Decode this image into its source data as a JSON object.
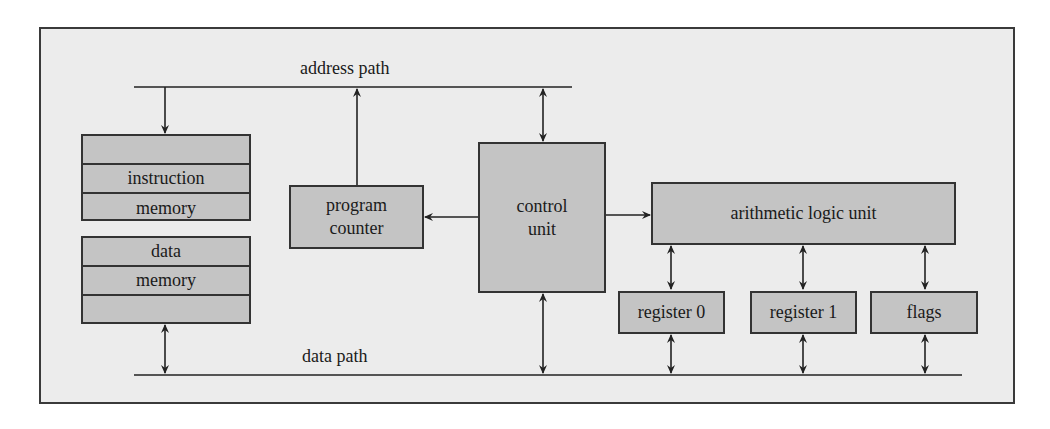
{
  "diagram": {
    "buses": {
      "address_path": "address path",
      "data_path": "data path"
    },
    "instruction_memory": {
      "rows": [
        "",
        "instruction",
        "memory"
      ]
    },
    "data_memory": {
      "rows": [
        "data",
        "memory",
        ""
      ]
    },
    "program_counter": {
      "line1": "program",
      "line2": "counter"
    },
    "control_unit": {
      "line1": "control",
      "line2": "unit"
    },
    "alu": {
      "label": "arithmetic logic unit"
    },
    "registers": [
      {
        "label": "register 0"
      },
      {
        "label": "register 1"
      },
      {
        "label": "flags"
      }
    ],
    "colors": {
      "frame_background": "#ececec",
      "block_fill": "#c4c4c4",
      "stroke": "#333333"
    }
  }
}
